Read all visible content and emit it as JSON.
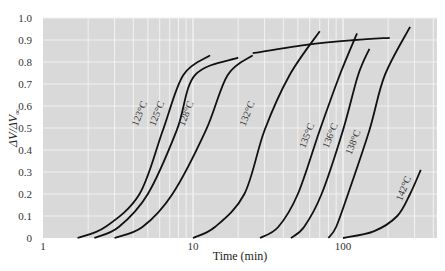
{
  "chart_data": {
    "type": "line",
    "title": "",
    "xlabel": "Time (min)",
    "ylabel": "ΔV/ΔV∞",
    "xscale": "log",
    "xlim": [
      1,
      426
    ],
    "ylim": [
      0,
      1.0
    ],
    "grid": true,
    "legend": "none (curves labeled inline)",
    "x_ticks": [
      "1",
      "10",
      "100"
    ],
    "y_ticks": [
      "0",
      "0.1",
      "0.2",
      "0.3",
      "0.4",
      "0.5",
      "0.6",
      "0.7",
      "0.8",
      "0.9",
      "1.0"
    ],
    "series": [
      {
        "name": "123°C",
        "x": [
          1.7,
          2.6,
          4.4,
          6.3,
          8.6,
          13
        ],
        "y": [
          0,
          0.05,
          0.2,
          0.49,
          0.74,
          0.83
        ]
      },
      {
        "name": "125°C",
        "x": [
          2.2,
          3.2,
          5.0,
          7.8,
          10.3,
          20
        ],
        "y": [
          0,
          0.05,
          0.2,
          0.49,
          0.74,
          0.82
        ]
      },
      {
        "name": "128°C",
        "x": [
          3.0,
          4.6,
          7.3,
          12.2,
          17,
          25
        ],
        "y": [
          0,
          0.05,
          0.2,
          0.49,
          0.74,
          0.83
        ]
      },
      {
        "name": "132°C",
        "x": [
          10,
          14,
          22,
          30,
          44,
          70
        ],
        "y": [
          0,
          0.05,
          0.2,
          0.49,
          0.74,
          0.94
        ]
      },
      {
        "name": "135°C",
        "x": [
          28,
          37,
          50,
          70,
          95,
          124
        ],
        "y": [
          0,
          0.05,
          0.2,
          0.49,
          0.74,
          0.93
        ]
      },
      {
        "name": "136°C",
        "x": [
          45,
          55,
          72,
          100,
          126,
          150
        ],
        "y": [
          0,
          0.05,
          0.2,
          0.49,
          0.74,
          0.86
        ]
      },
      {
        "name": "138°C",
        "x": [
          80,
          90,
          108,
          150,
          190,
          280
        ],
        "y": [
          0,
          0.05,
          0.2,
          0.49,
          0.74,
          0.96
        ]
      },
      {
        "name": "142°C",
        "x": [
          100,
          160,
          230,
          280,
          330
        ],
        "y": [
          0,
          0.03,
          0.1,
          0.2,
          0.31
        ]
      },
      {
        "name": "plateau",
        "x": [
          25,
          60,
          120,
          205
        ],
        "y": [
          0.84,
          0.88,
          0.9,
          0.91
        ]
      }
    ]
  },
  "labels": {
    "xlabel": "Time (min)",
    "ylabel_main": "ΔV/ΔV",
    "ylabel_sub": "∞",
    "x_ticks": [
      {
        "text": "1",
        "value": 1
      },
      {
        "text": "10",
        "value": 10
      },
      {
        "text": "100",
        "value": 100
      }
    ],
    "y_ticks": [
      "0",
      "0.1",
      "0.2",
      "0.3",
      "0.4",
      "0.5",
      "0.6",
      "0.7",
      "0.8",
      "0.9",
      "1.0"
    ],
    "curves": [
      {
        "text": "123°C",
        "x": 4.6,
        "y": 0.56
      },
      {
        "text": "125°C",
        "x": 6.0,
        "y": 0.56
      },
      {
        "text": "128°C",
        "x": 9.4,
        "y": 0.56
      },
      {
        "text": "132°C",
        "x": 24,
        "y": 0.56
      },
      {
        "text": "135°C",
        "x": 60,
        "y": 0.46
      },
      {
        "text": "136°C",
        "x": 86,
        "y": 0.46
      },
      {
        "text": "138°C",
        "x": 122,
        "y": 0.43
      },
      {
        "text": "142°C",
        "x": 265,
        "y": 0.22
      }
    ]
  },
  "colors": {
    "plot_bg": "#d9d9d9",
    "grid": "#f2f2f2",
    "curve": "#111111"
  }
}
